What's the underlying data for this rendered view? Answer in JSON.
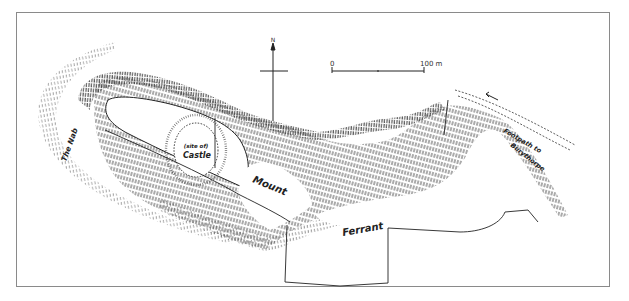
{
  "map": {
    "title": "Mount Ferrant",
    "labels": {
      "the_nab": "The Nab",
      "site_of": "(site of)",
      "castle": "Castle",
      "mount": "Mount",
      "ferrant": "Ferrant",
      "footpath": "Footpath to",
      "burythorpe": "Burythorpe"
    },
    "north_arrow": {
      "label": "N"
    },
    "scale_bar": {
      "start_label": "0",
      "end_label": "100 m",
      "length_m": 100
    },
    "colors": {
      "ink": "#2a2a2a",
      "frame": "#8a8a8a",
      "background": "#ffffff"
    }
  }
}
